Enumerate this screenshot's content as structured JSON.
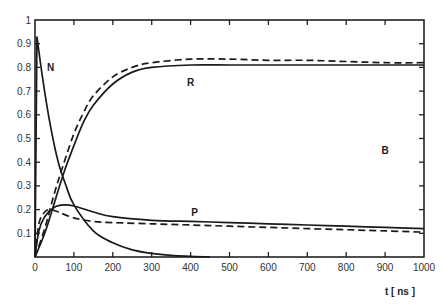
{
  "chart_data": {
    "type": "line",
    "title": "",
    "xlabel": "t [ ns ]",
    "ylabel": "",
    "xlim": [
      0,
      1000
    ],
    "ylim": [
      0,
      1
    ],
    "grid": false,
    "x_ticks": [
      "0",
      "100",
      "200",
      "300",
      "400",
      "500",
      "600",
      "700",
      "800",
      "900",
      "1000"
    ],
    "y_ticks": [
      "0.1",
      "0.2",
      "0.3",
      "0.4",
      "0.5",
      "0.6",
      "0.7",
      "0.8",
      "0.9",
      "1"
    ],
    "annotations": [
      {
        "text": "N",
        "x": 40,
        "y": 0.8
      },
      {
        "text": "R",
        "x": 400,
        "y": 0.74
      },
      {
        "text": "P",
        "x": 410,
        "y": 0.19
      },
      {
        "text": "B",
        "x": 900,
        "y": 0.45
      }
    ],
    "series": [
      {
        "name": "N",
        "style": "solid",
        "x": [
          0,
          5,
          20,
          40,
          60,
          80,
          100,
          150,
          200,
          250,
          300,
          350,
          400,
          450
        ],
        "values": [
          0.0,
          0.93,
          0.75,
          0.55,
          0.4,
          0.3,
          0.22,
          0.11,
          0.06,
          0.03,
          0.015,
          0.007,
          0.003,
          0.0
        ]
      },
      {
        "name": "R (solid)",
        "style": "solid",
        "x": [
          0,
          25,
          50,
          75,
          100,
          125,
          150,
          200,
          250,
          300,
          400,
          500,
          600,
          700,
          800,
          900,
          1000
        ],
        "values": [
          0.0,
          0.1,
          0.23,
          0.36,
          0.47,
          0.57,
          0.64,
          0.73,
          0.78,
          0.8,
          0.81,
          0.81,
          0.81,
          0.81,
          0.81,
          0.81,
          0.81
        ]
      },
      {
        "name": "R (dashed)",
        "style": "dashed",
        "x": [
          0,
          25,
          50,
          75,
          100,
          125,
          150,
          200,
          250,
          300,
          400,
          500,
          600,
          700,
          800,
          900,
          1000
        ],
        "values": [
          0.0,
          0.12,
          0.27,
          0.4,
          0.52,
          0.61,
          0.68,
          0.76,
          0.8,
          0.82,
          0.835,
          0.835,
          0.83,
          0.83,
          0.825,
          0.82,
          0.82
        ]
      },
      {
        "name": "P (solid)",
        "style": "solid",
        "x": [
          0,
          10,
          25,
          50,
          75,
          100,
          150,
          200,
          300,
          400,
          500,
          600,
          700,
          800,
          900,
          1000
        ],
        "values": [
          0.0,
          0.11,
          0.17,
          0.21,
          0.22,
          0.215,
          0.19,
          0.17,
          0.155,
          0.15,
          0.145,
          0.14,
          0.135,
          0.13,
          0.125,
          0.12
        ]
      },
      {
        "name": "P (dashed)",
        "style": "dashed",
        "x": [
          0,
          10,
          25,
          40,
          60,
          100,
          150,
          200,
          300,
          400,
          500,
          600,
          700,
          800,
          900,
          1000
        ],
        "values": [
          0.0,
          0.14,
          0.19,
          0.2,
          0.19,
          0.165,
          0.15,
          0.145,
          0.14,
          0.135,
          0.13,
          0.125,
          0.12,
          0.115,
          0.11,
          0.105
        ]
      }
    ]
  }
}
